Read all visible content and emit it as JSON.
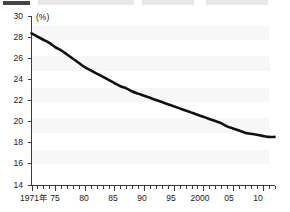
{
  "chart_data": {
    "type": "line",
    "title": "",
    "subtitle": "",
    "xlabel": "",
    "ylabel": "",
    "unit_label": "(%)",
    "grid": false,
    "legend": "none",
    "xlim": [
      1971,
      2012
    ],
    "ylim": [
      14,
      30
    ],
    "ytick_step": 2,
    "yticks": [
      14,
      16,
      18,
      20,
      22,
      24,
      26,
      28,
      30
    ],
    "ytick_labels": [
      "14",
      "16",
      "18",
      "20",
      "22",
      "24",
      "26",
      "28",
      "30"
    ],
    "xticks": [
      1971,
      1975,
      1980,
      1985,
      1990,
      1995,
      2000,
      2005,
      2010
    ],
    "xtick_labels": [
      "1971年",
      "75",
      "80",
      "85",
      "90",
      "95",
      "2000",
      "05",
      "10"
    ],
    "minor_xticks_every_year": true,
    "line_color": "#111111",
    "series": [
      {
        "name": "",
        "x": [
          1971,
          1972,
          1973,
          1974,
          1975,
          1976,
          1977,
          1978,
          1979,
          1980,
          1981,
          1982,
          1983,
          1984,
          1985,
          1986,
          1987,
          1988,
          1989,
          1990,
          1991,
          1992,
          1993,
          1994,
          1995,
          1996,
          1997,
          1998,
          1999,
          2000,
          2001,
          2002,
          2003,
          2004,
          2005,
          2006,
          2007,
          2008,
          2009,
          2010,
          2011,
          2012
        ],
        "values": [
          28.4,
          28.1,
          27.8,
          27.5,
          27.1,
          26.8,
          26.4,
          26.0,
          25.6,
          25.2,
          24.9,
          24.6,
          24.3,
          24.0,
          23.7,
          23.4,
          23.2,
          22.9,
          22.7,
          22.5,
          22.3,
          22.1,
          21.9,
          21.7,
          21.5,
          21.3,
          21.1,
          20.9,
          20.7,
          20.5,
          20.3,
          20.1,
          19.9,
          19.6,
          19.4,
          19.2,
          19.0,
          18.9,
          18.8,
          18.7,
          18.6,
          18.6
        ]
      }
    ]
  },
  "axes": {
    "y_unit": "(%)"
  }
}
